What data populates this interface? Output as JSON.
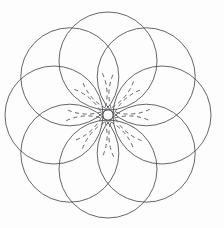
{
  "figure": {
    "background_color": "#fdfdfd",
    "stroke_color": "#4a4a4e",
    "stroke_width": 0.85,
    "canvas": {
      "width": 224,
      "height": 228
    },
    "center": {
      "x": 108,
      "y": 115
    },
    "petal_count": 8,
    "bounds": {
      "left": 11,
      "top": 11,
      "right": 205,
      "bottom": 218
    },
    "solid_circles": {
      "name": "petal-circles",
      "count": 8,
      "radius": 49,
      "ring_radius": 54,
      "start_angle_deg": -90,
      "centers": [
        {
          "x": 108.0,
          "y": 61.0
        },
        {
          "x": 146.2,
          "y": 76.8
        },
        {
          "x": 162.0,
          "y": 115.0
        },
        {
          "x": 146.2,
          "y": 153.2
        },
        {
          "x": 108.0,
          "y": 169.0
        },
        {
          "x": 69.8,
          "y": 153.2
        },
        {
          "x": 54.0,
          "y": 115.0
        },
        {
          "x": 69.8,
          "y": 76.8
        }
      ]
    },
    "dashed_circles": {
      "name": "inner-dashed-circles",
      "count": 8,
      "radius": 49,
      "ring_radius": 54,
      "start_angle_deg": -67.5,
      "dash_pattern": "4.2 3.4",
      "arc_span_deg": 96,
      "centers": [
        {
          "x": 128.7,
          "y": 65.1
        },
        {
          "x": 157.9,
          "y": 94.3
        },
        {
          "x": 157.9,
          "y": 135.7
        },
        {
          "x": 128.7,
          "y": 164.9
        },
        {
          "x": 87.3,
          "y": 164.9
        },
        {
          "x": 58.1,
          "y": 135.7
        },
        {
          "x": 58.1,
          "y": 94.3
        },
        {
          "x": 87.3,
          "y": 65.1
        }
      ]
    },
    "crossing_points": {
      "name": "petal-cusps",
      "count": 8,
      "radius": 78,
      "points": [
        {
          "x": 108.0,
          "y": 37.0
        },
        {
          "x": 163.2,
          "y": 60.0
        },
        {
          "x": 186.0,
          "y": 115.0
        },
        {
          "x": 163.2,
          "y": 170.0
        },
        {
          "x": 108.0,
          "y": 193.0
        },
        {
          "x": 52.8,
          "y": 170.0
        },
        {
          "x": 30.0,
          "y": 115.0
        },
        {
          "x": 52.8,
          "y": 60.0
        }
      ]
    }
  }
}
